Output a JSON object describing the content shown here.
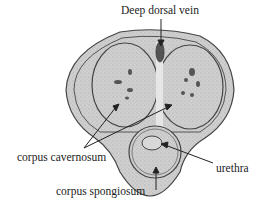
{
  "diagram": {
    "type": "anatomical cross-section",
    "labels": {
      "deep_dorsal_vein": "Deep dorsal vein",
      "corpus_cavernosum": "corpus cavernosum",
      "urethra": "urethra",
      "corpus_spongiosum": "corpus spongiosum"
    },
    "colors": {
      "tissue_fill": "#c9c9c9",
      "outline": "#444444",
      "background": "#ffffff",
      "text": "#222222"
    }
  }
}
